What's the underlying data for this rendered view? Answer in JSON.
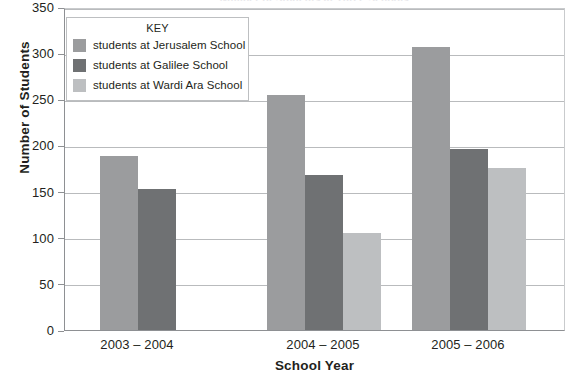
{
  "chart_data": {
    "type": "bar",
    "title": "Number of Students at Three Schools",
    "xlabel": "School Year",
    "ylabel": "Number of Students",
    "categories": [
      "2003 – 2004",
      "2004 – 2005",
      "2005 – 2006"
    ],
    "series": [
      {
        "name": "students at Jerusalem School",
        "values": [
          189,
          255,
          307
        ],
        "color": "#9b9c9e"
      },
      {
        "name": "students at Galilee School",
        "values": [
          153,
          168,
          196
        ],
        "color": "#6f7173"
      },
      {
        "name": "students at Wardi Ara School",
        "values": [
          null,
          105,
          176
        ],
        "color": "#bdbfc1"
      }
    ],
    "ylim": [
      0,
      350
    ],
    "ytick_step": 50,
    "yticks": [
      "0",
      "50",
      "100",
      "150",
      "200",
      "250",
      "300",
      "350"
    ],
    "grid": true,
    "legend_position": "inside-top-left",
    "legend_title": "KEY"
  },
  "legend": {
    "title": "KEY",
    "entries": [
      {
        "label": "students at Jerusalem School",
        "color": "#9b9c9e"
      },
      {
        "label": "students at Galilee School",
        "color": "#6f7173"
      },
      {
        "label": "students at Wardi Ara School",
        "color": "#bdbfc1"
      }
    ]
  }
}
